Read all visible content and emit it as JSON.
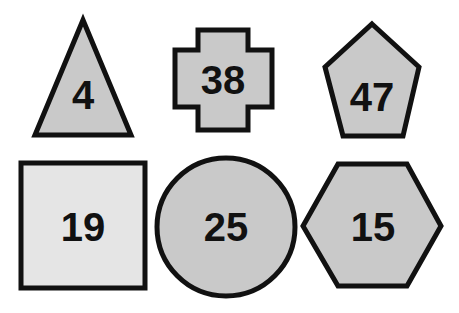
{
  "colors": {
    "stroke": "#111111",
    "fill_default": "#c9c9c9",
    "fill_light": "#e5e5e5",
    "background": "#ffffff"
  },
  "shapes": [
    {
      "type": "triangle",
      "label": "4",
      "fill": "#c9c9c9",
      "points": "83,20 35,135 131,135",
      "tx": 83,
      "ty": 109
    },
    {
      "type": "cross",
      "label": "38",
      "fill": "#c9c9c9",
      "points": "198,30 248,30 248,50 272,50 272,107 248,107 248,130 198,130 198,107 175,107 175,50 198,50",
      "tx": 223,
      "ty": 94
    },
    {
      "type": "pentagon",
      "label": "47",
      "fill": "#c9c9c9",
      "points": "372,24 419,67 403,136 343,136 325,67",
      "tx": 372,
      "ty": 111
    },
    {
      "type": "square",
      "label": "19",
      "fill": "#e5e5e5",
      "points": "21,163 145,163 145,288 21,288",
      "tx": 83,
      "ty": 241
    },
    {
      "type": "circle",
      "label": "25",
      "fill": "#c9c9c9",
      "cx": 226,
      "cy": 227,
      "r": 69,
      "tx": 226,
      "ty": 241
    },
    {
      "type": "hexagon",
      "label": "15",
      "fill": "#c9c9c9",
      "points": "303,226 338,164 407,164 441,226 407,286 338,286",
      "tx": 373,
      "ty": 241
    }
  ]
}
